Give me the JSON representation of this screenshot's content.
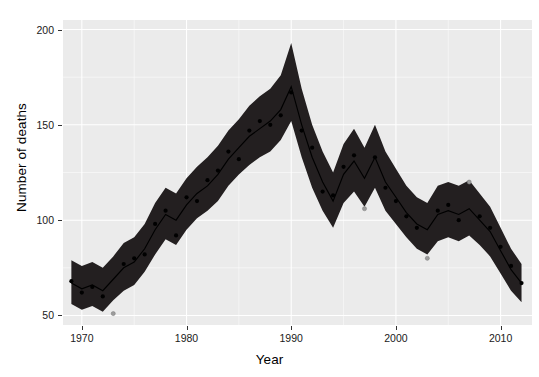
{
  "chart_data": {
    "type": "line",
    "title": "",
    "subtitle": "",
    "xlabel": "Year",
    "ylabel": "Number of deaths",
    "xlim": [
      1968.2,
      1913.0
    ],
    "x_range": [
      1968.2,
      2013.0
    ],
    "ylim": [
      45,
      205
    ],
    "grid": true,
    "legend": "none",
    "x_ticks": [
      1970,
      1980,
      1990,
      2000,
      2010
    ],
    "x_tick_labels": [
      "1970",
      "1980",
      "1990",
      "2000",
      "2010"
    ],
    "x_minor_ticks": [
      1975,
      1985,
      1995,
      2005
    ],
    "y_ticks": [
      50,
      100,
      150,
      200
    ],
    "y_tick_labels": [
      "50",
      "100",
      "150",
      "200"
    ],
    "y_minor_ticks": [
      75,
      125,
      175
    ],
    "x": [
      1969,
      1970,
      1971,
      1972,
      1973,
      1974,
      1975,
      1976,
      1977,
      1978,
      1979,
      1980,
      1981,
      1982,
      1983,
      1984,
      1985,
      1986,
      1987,
      1988,
      1989,
      1990,
      1991,
      1992,
      1993,
      1994,
      1995,
      1996,
      1997,
      1998,
      1999,
      2000,
      2001,
      2002,
      2003,
      2004,
      2005,
      2006,
      2007,
      2008,
      2009,
      2010,
      2011,
      2012
    ],
    "series": [
      {
        "name": "fitted",
        "style": "line",
        "values": [
          67,
          64,
          66,
          63,
          69,
          75,
          78,
          85,
          95,
          103,
          100,
          108,
          114,
          118,
          124,
          132,
          138,
          144,
          148,
          152,
          158,
          170,
          150,
          133,
          120,
          110,
          124,
          131,
          122,
          133,
          120,
          112,
          104,
          98,
          95,
          103,
          105,
          103,
          106,
          100,
          94,
          84,
          74,
          67
        ]
      },
      {
        "name": "confidence-band-upper",
        "style": "ribbon-upper",
        "values": [
          79,
          76,
          78,
          75,
          81,
          88,
          91,
          98,
          109,
          117,
          114,
          122,
          128,
          133,
          139,
          147,
          153,
          160,
          165,
          169,
          176,
          193,
          169,
          150,
          136,
          125,
          140,
          148,
          138,
          150,
          136,
          127,
          118,
          112,
          109,
          118,
          120,
          118,
          121,
          114,
          107,
          96,
          85,
          77
        ]
      },
      {
        "name": "confidence-band-lower",
        "style": "ribbon-lower",
        "values": [
          56,
          53,
          55,
          52,
          58,
          63,
          66,
          73,
          82,
          90,
          87,
          95,
          101,
          105,
          110,
          118,
          124,
          129,
          133,
          136,
          142,
          152,
          133,
          117,
          105,
          96,
          109,
          115,
          107,
          117,
          105,
          98,
          91,
          85,
          82,
          89,
          91,
          89,
          92,
          87,
          81,
          72,
          63,
          57
        ]
      },
      {
        "name": "observed",
        "style": "points",
        "values": [
          68,
          62,
          65,
          60,
          51,
          77,
          80,
          82,
          98,
          105,
          92,
          112,
          110,
          121,
          126,
          136,
          132,
          147,
          152,
          150,
          155,
          167,
          147,
          138,
          115,
          113,
          128,
          134,
          106,
          133,
          117,
          110,
          102,
          96,
          80,
          105,
          108,
          100,
          120,
          102,
          96,
          86,
          76,
          67
        ],
        "point_classes": [
          "dark",
          "dark",
          "dark",
          "dark",
          "light",
          "dark",
          "dark",
          "dark",
          "dark",
          "dark",
          "dark",
          "dark",
          "dark",
          "dark",
          "dark",
          "dark",
          "dark",
          "dark",
          "dark",
          "dark",
          "dark",
          "dark",
          "dark",
          "dark",
          "dark",
          "dark",
          "dark",
          "dark",
          "light",
          "dark",
          "dark",
          "dark",
          "dark",
          "dark",
          "light",
          "dark",
          "dark",
          "dark",
          "light",
          "dark",
          "dark",
          "dark",
          "dark",
          "dark"
        ]
      }
    ],
    "colors": {
      "panel_background": "#ebebeb",
      "gridline": "#ffffff",
      "ribbon": "#231f20",
      "line": "#000000",
      "point_inside": "#000000",
      "point_outside": "#9c9c9c",
      "text": "#1a1a1a"
    }
  }
}
